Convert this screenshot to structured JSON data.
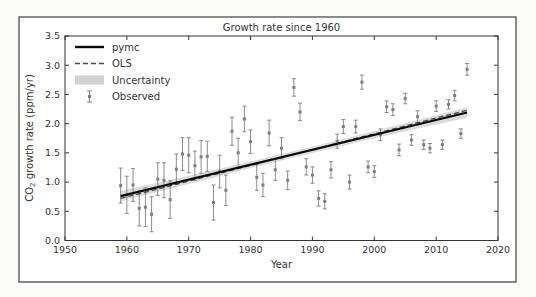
{
  "window": {
    "background": "#fbfbfa",
    "frame_color": "#3f3f3f"
  },
  "chart_data": {
    "type": "scatter",
    "title": "Growth rate since 1960",
    "xlabel": "Year",
    "ylabel": "CO₂ growth rate (ppm/yr)",
    "ylabel_parts": {
      "pre": "CO",
      "sub": "2",
      "post": " growth rate (ppm/yr)"
    },
    "xlim": [
      1950,
      2020
    ],
    "ylim": [
      0.0,
      3.5
    ],
    "xticks": [
      1950,
      1960,
      1970,
      1980,
      1990,
      2000,
      2010,
      2020
    ],
    "yticks": [
      0.0,
      0.5,
      1.0,
      1.5,
      2.0,
      2.5,
      3.0,
      3.5
    ],
    "grid": false,
    "legend": {
      "position": "upper left",
      "items": [
        {
          "label": "pymc",
          "kind": "solid-line"
        },
        {
          "label": "OLS",
          "kind": "dashed-line"
        },
        {
          "label": "Uncertainty",
          "kind": "band"
        },
        {
          "label": "Observed",
          "kind": "errorbar"
        }
      ]
    },
    "colors": {
      "pymc": "#0a0a0a",
      "ols": "#4a4a4a",
      "uncertainty": "#bdbdbd",
      "observed": "#7e7e7e",
      "text": "#333333",
      "axis": "#333333"
    },
    "series": [
      {
        "name": "pymc",
        "kind": "line",
        "style": "solid",
        "width": 2.2,
        "x": [
          1959,
          2015
        ],
        "y": [
          0.76,
          2.19
        ]
      },
      {
        "name": "OLS",
        "kind": "line",
        "style": "dashed",
        "width": 1.3,
        "x": [
          1959,
          2015
        ],
        "y": [
          0.72,
          2.23
        ]
      },
      {
        "name": "Uncertainty",
        "kind": "band",
        "x": [
          1959,
          1966,
          1973,
          1980,
          1987,
          1994,
          2001,
          2008,
          2015
        ],
        "upper": [
          0.85,
          1.01,
          1.18,
          1.35,
          1.53,
          1.71,
          1.9,
          2.09,
          2.28
        ],
        "lower": [
          0.67,
          0.86,
          1.05,
          1.24,
          1.42,
          1.6,
          1.77,
          1.94,
          2.1
        ]
      },
      {
        "name": "Observed",
        "kind": "errorbar",
        "marker": "square",
        "x": [
          1959,
          1960,
          1961,
          1962,
          1963,
          1964,
          1965,
          1966,
          1967,
          1968,
          1969,
          1970,
          1971,
          1972,
          1973,
          1974,
          1975,
          1976,
          1977,
          1978,
          1979,
          1980,
          1981,
          1982,
          1983,
          1984,
          1985,
          1986,
          1987,
          1988,
          1989,
          1990,
          1991,
          1992,
          1993,
          1994,
          1995,
          1996,
          1997,
          1998,
          1999,
          2000,
          2001,
          2002,
          2003,
          2004,
          2005,
          2006,
          2007,
          2008,
          2009,
          2010,
          2011,
          2012,
          2013,
          2014,
          2015
        ],
        "y": [
          0.94,
          0.78,
          0.95,
          0.55,
          0.57,
          0.45,
          1.05,
          1.03,
          0.7,
          1.22,
          1.48,
          1.46,
          1.28,
          1.43,
          1.44,
          0.65,
          1.18,
          0.86,
          1.87,
          1.5,
          2.08,
          1.69,
          1.08,
          0.95,
          1.84,
          1.21,
          1.58,
          1.03,
          2.62,
          2.2,
          1.26,
          1.12,
          0.72,
          0.67,
          1.21,
          1.7,
          1.95,
          1.0,
          1.95,
          2.71,
          1.26,
          1.18,
          1.81,
          2.29,
          2.24,
          1.55,
          2.43,
          1.72,
          2.12,
          1.64,
          1.58,
          2.3,
          1.64,
          2.33,
          2.48,
          1.83,
          2.93
        ],
        "yerr": [
          0.3,
          0.32,
          0.28,
          0.3,
          0.33,
          0.3,
          0.28,
          0.3,
          0.32,
          0.26,
          0.28,
          0.3,
          0.25,
          0.28,
          0.26,
          0.3,
          0.28,
          0.26,
          0.24,
          0.25,
          0.22,
          0.2,
          0.22,
          0.2,
          0.22,
          0.18,
          0.18,
          0.16,
          0.15,
          0.15,
          0.14,
          0.14,
          0.13,
          0.13,
          0.14,
          0.12,
          0.12,
          0.12,
          0.11,
          0.12,
          0.1,
          0.1,
          0.1,
          0.1,
          0.1,
          0.1,
          0.09,
          0.09,
          0.1,
          0.08,
          0.08,
          0.09,
          0.08,
          0.08,
          0.09,
          0.08,
          0.1
        ]
      }
    ]
  }
}
